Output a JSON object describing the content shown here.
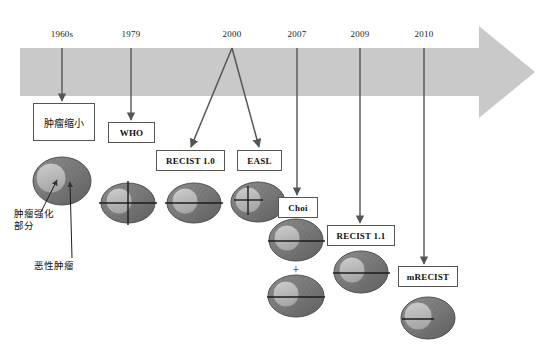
{
  "figure": {
    "type": "timeline-diagram"
  },
  "timeline": {
    "arrow_color": "#c9c9c9",
    "years": [
      {
        "label": "1960s",
        "x": 62
      },
      {
        "label": "1979",
        "x": 131
      },
      {
        "label": "2000",
        "x": 232
      },
      {
        "label": "2007",
        "x": 297
      },
      {
        "label": "2009",
        "x": 360
      },
      {
        "label": "2010",
        "x": 424
      }
    ]
  },
  "nodes": [
    {
      "id": "tumor-shrinkage",
      "label": "肿瘤缩小",
      "lang": "cn",
      "x": 33,
      "y": 103,
      "w": 62,
      "h": 38
    },
    {
      "id": "who",
      "label": "WHO",
      "lang": "en",
      "x": 108,
      "y": 122,
      "w": 47,
      "h": 21
    },
    {
      "id": "recist10",
      "label": "RECIST 1.0",
      "lang": "en",
      "x": 156,
      "y": 150,
      "w": 69,
      "h": 21
    },
    {
      "id": "easl",
      "label": "EASL",
      "lang": "en",
      "x": 237,
      "y": 150,
      "w": 45,
      "h": 21
    },
    {
      "id": "choi",
      "label": "Choi",
      "lang": "en",
      "x": 278,
      "y": 197,
      "w": 40,
      "h": 21
    },
    {
      "id": "recist11",
      "label": "RECIST 1.1",
      "lang": "en",
      "x": 327,
      "y": 225,
      "w": 68,
      "h": 21
    },
    {
      "id": "mrecist",
      "label": "mRECIST",
      "lang": "en",
      "x": 398,
      "y": 266,
      "w": 60,
      "h": 21
    }
  ],
  "annotations": [
    {
      "id": "enhancing-portion",
      "text": "肿瘤强化\n部分",
      "x": 14,
      "y": 208
    },
    {
      "id": "malignant-tumor",
      "text": "恶性肿瘤",
      "x": 34,
      "y": 260
    }
  ],
  "operators": [
    {
      "id": "choi-plus",
      "label": "+",
      "x": 296,
      "y": 265
    }
  ],
  "tumor_icons": [
    {
      "id": "legend-tumor",
      "marks": "none",
      "cx": 62,
      "cy": 181,
      "rx": 29,
      "ry": 24
    },
    {
      "id": "who-tumor",
      "marks": "cross-full",
      "cx": 128,
      "cy": 203,
      "rx": 27,
      "ry": 20
    },
    {
      "id": "recist10-tumor",
      "marks": "line-full",
      "cx": 194,
      "cy": 203,
      "rx": 27,
      "ry": 20
    },
    {
      "id": "easl-tumor",
      "marks": "cross-enhancing",
      "cx": 258,
      "cy": 202,
      "rx": 27,
      "ry": 20
    },
    {
      "id": "choi-tumor-a",
      "marks": "line-full",
      "cx": 296,
      "cy": 240,
      "rx": 27,
      "ry": 21
    },
    {
      "id": "choi-tumor-b",
      "marks": "line-full",
      "cx": 296,
      "cy": 296,
      "rx": 28,
      "ry": 21
    },
    {
      "id": "recist11-tumor",
      "marks": "line-full",
      "cx": 361,
      "cy": 272,
      "rx": 27,
      "ry": 21
    },
    {
      "id": "mrecist-tumor",
      "marks": "line-enhancing",
      "cx": 428,
      "cy": 318,
      "rx": 27,
      "ry": 21
    }
  ],
  "colors": {
    "band": "#c9c9c9",
    "tumor_dark": "#6f6f6f",
    "tumor_light": "#b9b9b9",
    "connector": "#555555",
    "text": "#111111"
  }
}
